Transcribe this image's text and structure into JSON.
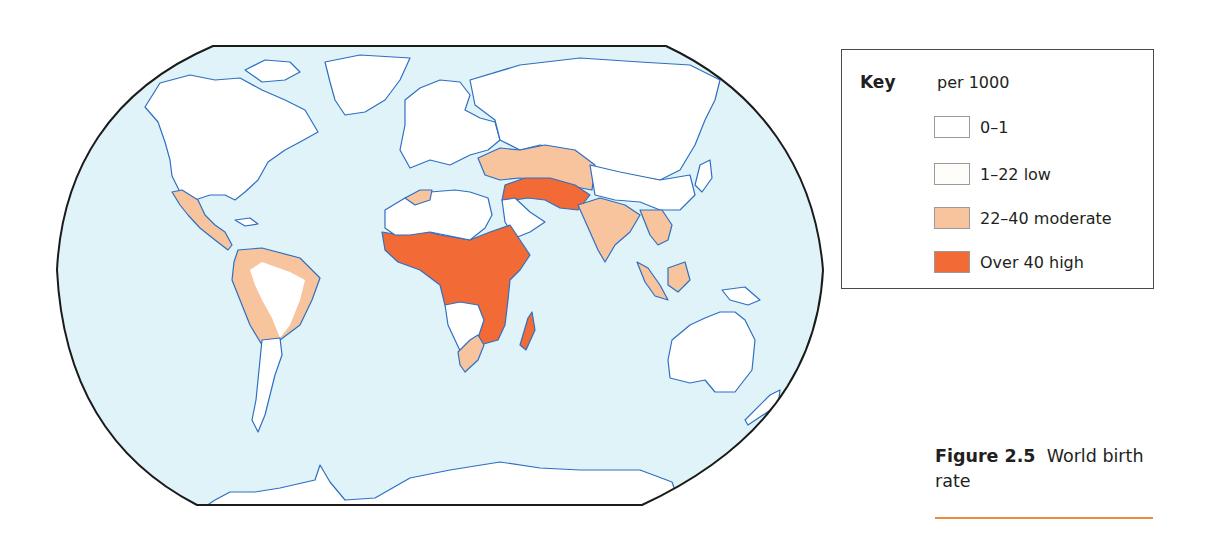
{
  "figure": {
    "number_label": "Figure 2.5",
    "title": "World birth rate",
    "accent_rule_color": "#f08a3c"
  },
  "map": {
    "projection": "world outline map, flattened-ellipse frame",
    "colors": {
      "ocean": "#dff3f8",
      "frame": "#1b1b1b",
      "coastline": "#2e6fc4",
      "land_low": "#ffffff",
      "land_moderate": "#f8c49e",
      "land_high": "#f26a35"
    },
    "regions": [
      {
        "name": "North America",
        "category": "1-22 low"
      },
      {
        "name": "Greenland",
        "category": "0-1"
      },
      {
        "name": "Mexico & Central America",
        "category": "22-40 moderate"
      },
      {
        "name": "Northern South America",
        "category": "22-40 moderate"
      },
      {
        "name": "Southern South America",
        "category": "1-22 low"
      },
      {
        "name": "Europe",
        "category": "1-22 low"
      },
      {
        "name": "Russia & North Asia",
        "category": "1-22 low"
      },
      {
        "name": "Maghreb coast",
        "category": "22-40 moderate"
      },
      {
        "name": "Sahara",
        "category": "1-22 low"
      },
      {
        "name": "Sub-Saharan Africa",
        "category": "Over 40 high"
      },
      {
        "name": "Southern Africa interior",
        "category": "1-22 low"
      },
      {
        "name": "South Africa coast",
        "category": "22-40 moderate"
      },
      {
        "name": "Madagascar",
        "category": "Over 40 high"
      },
      {
        "name": "Arabian Peninsula interior",
        "category": "1-22 low"
      },
      {
        "name": "Middle East / Iran / Pakistan / Afghanistan",
        "category": "Over 40 high"
      },
      {
        "name": "Turkey & Central Asia",
        "category": "22-40 moderate"
      },
      {
        "name": "South Asia (India)",
        "category": "22-40 moderate"
      },
      {
        "name": "Southeast Asia",
        "category": "22-40 moderate"
      },
      {
        "name": "China & East Asia",
        "category": "1-22 low"
      },
      {
        "name": "Australia",
        "category": "1-22 low"
      },
      {
        "name": "Antarctica",
        "category": "0-1"
      }
    ]
  },
  "key": {
    "title": "Key",
    "unit": "per 1000",
    "items": [
      {
        "label": "0–1",
        "color": "#ffffff"
      },
      {
        "label": "1–22 low",
        "color": "#fffdf9"
      },
      {
        "label": "22–40 moderate",
        "color": "#f8c49e"
      },
      {
        "label": "Over 40 high",
        "color": "#f26a35"
      }
    ]
  }
}
